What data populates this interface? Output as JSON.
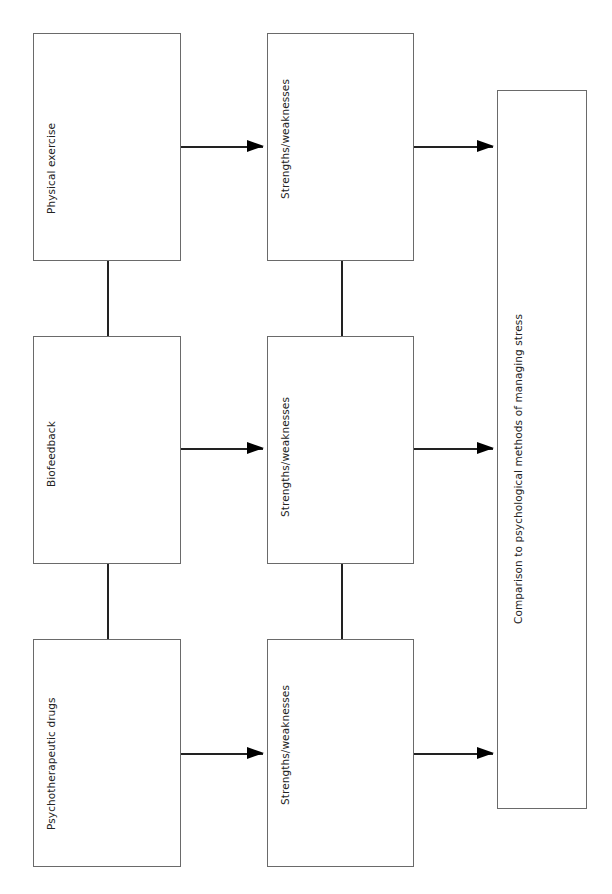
{
  "diagram": {
    "methods": [
      {
        "label": "Physical exercise"
      },
      {
        "label": "Biofeedback"
      },
      {
        "label": "Psychotherapeutic drugs"
      }
    ],
    "evaluations": [
      {
        "label": "Strengths/weaknesses"
      },
      {
        "label": "Strengths/weaknesses"
      },
      {
        "label": "Strengths/weaknesses"
      }
    ],
    "outcome": {
      "label": "Comparison to psychological methods of managing stress"
    },
    "colors": {
      "border": "#6a6a6a",
      "line": "#222222",
      "text": "#222222"
    }
  }
}
